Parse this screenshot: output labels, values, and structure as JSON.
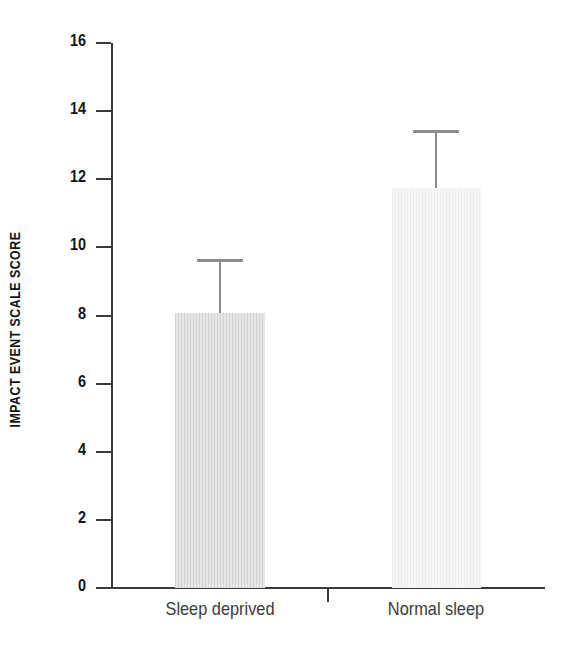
{
  "chart_data": {
    "type": "bar",
    "title": "",
    "subtitle": "",
    "xlabel": "",
    "ylabel": "IMPACT EVENT SCALE SCORE",
    "categories": [
      "Sleep deprived",
      "Normal sleep"
    ],
    "values": [
      8.07,
      11.74
    ],
    "errors_upper": [
      1.6,
      1.7
    ],
    "error_tops": [
      9.66,
      13.45
    ],
    "ylim": [
      0,
      16
    ],
    "ytick_labels": [
      "0",
      "2",
      "4",
      "6",
      "8",
      "10",
      "12",
      "14",
      "16"
    ],
    "ytick_values": [
      0,
      2,
      4,
      6,
      8,
      10,
      12,
      14,
      16
    ],
    "grid": false,
    "legend": "none",
    "series": [
      {
        "name": "Impact Event Scale score",
        "values": [
          8.07,
          11.74
        ],
        "error_upper": [
          1.6,
          1.7
        ]
      }
    ],
    "bar_styles": [
      {
        "category": "Sleep deprived",
        "fill": "#dcdcdc",
        "pattern": "vertical-stripes"
      },
      {
        "category": "Normal sleep",
        "fill": "#f2f2f2",
        "pattern": "vertical-stripes-light"
      }
    ],
    "colors": {
      "axis": "#3a3a3a",
      "text": "#141414",
      "error_bar": "#8c8c8c",
      "background": "#ffffff"
    }
  },
  "axis": {
    "y_label": "IMPACT EVENT SCALE SCORE",
    "ticks": [
      {
        "label": "16",
        "value": 16
      },
      {
        "label": "14",
        "value": 14
      },
      {
        "label": "12",
        "value": 12
      },
      {
        "label": "10",
        "value": 10
      },
      {
        "label": "8",
        "value": 8
      },
      {
        "label": "6",
        "value": 6
      },
      {
        "label": "4",
        "value": 4
      },
      {
        "label": "2",
        "value": 2
      },
      {
        "label": "0",
        "value": 0
      }
    ]
  },
  "categories": [
    {
      "label": "Sleep deprived"
    },
    {
      "label": "Normal sleep"
    }
  ]
}
